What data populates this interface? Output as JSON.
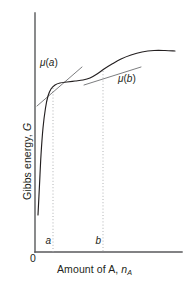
{
  "figure": {
    "axes": {
      "y_title_prefix": "Gibbs energy, ",
      "y_title_symbol": "G",
      "x_title_prefix": "Amount of A, ",
      "x_title_symbol": "n",
      "x_title_subscript": "A",
      "origin_label": "0"
    },
    "ticks": [
      {
        "name": "a",
        "label": "a",
        "x_px": 53
      },
      {
        "name": "b",
        "label": "b",
        "x_px": 103
      }
    ],
    "annotations": [
      {
        "name": "mu-a",
        "mu": "μ",
        "open": "(",
        "arg": "a",
        "close": ")"
      },
      {
        "name": "mu-b",
        "mu": "μ",
        "open": "(",
        "arg": "b",
        "close": ")"
      }
    ],
    "colors": {
      "axis": "#58595b",
      "curve": "#231f20",
      "tangent": "#58595b",
      "guide": "#a7a9ac",
      "text": "#231f20",
      "background": "#ffffff"
    }
  },
  "chart_data": {
    "type": "line",
    "title": "",
    "xlabel": "Amount of A, n_A",
    "ylabel": "Gibbs energy, G",
    "xlim": [
      0,
      1
    ],
    "ylim": [
      0,
      1
    ],
    "grid": false,
    "legend": null,
    "axis_pixels": {
      "x_axis_y": 252,
      "y_axis_x": 35,
      "x_axis_right": 182,
      "y_axis_top": 13
    },
    "series": [
      {
        "name": "gibbs-energy-curve",
        "description": "Total Gibbs energy as a function of amount of A: steep initial rise, shallow plateau between a and b, second rise, then levelling off.",
        "points_px": [
          [
            38,
            215
          ],
          [
            39.5,
            185
          ],
          [
            41,
            155
          ],
          [
            43,
            128
          ],
          [
            45.5,
            108
          ],
          [
            48,
            96
          ],
          [
            51,
            89
          ],
          [
            55,
            85
          ],
          [
            60,
            83
          ],
          [
            67,
            82
          ],
          [
            75,
            81
          ],
          [
            83,
            80
          ],
          [
            90,
            78
          ],
          [
            97,
            74
          ],
          [
            104,
            69
          ],
          [
            112,
            64
          ],
          [
            121,
            59
          ],
          [
            131,
            55
          ],
          [
            142,
            52
          ],
          [
            154,
            50.5
          ],
          [
            165,
            50.5
          ],
          [
            175,
            51
          ]
        ]
      }
    ],
    "tangents": [
      {
        "name": "tangent-at-a",
        "label": "μ(a)",
        "touch_point_px": [
          53,
          87
        ],
        "from_px": [
          37,
          106
        ],
        "to_px": [
          82,
          67
        ],
        "meaning": "slope equals chemical potential of A at composition a"
      },
      {
        "name": "tangent-at-b",
        "label": "μ(b)",
        "touch_point_px": [
          103,
          70
        ],
        "from_px": [
          84,
          85
        ],
        "to_px": [
          141,
          67
        ],
        "meaning": "slope equals chemical potential of A at composition b"
      }
    ],
    "guides": [
      {
        "name": "guide-a",
        "x_px": 53,
        "from_y_px": 88,
        "to_y_px": 252,
        "style": "dotted"
      },
      {
        "name": "guide-b",
        "x_px": 103,
        "from_y_px": 71,
        "to_y_px": 252,
        "style": "dotted"
      }
    ]
  }
}
